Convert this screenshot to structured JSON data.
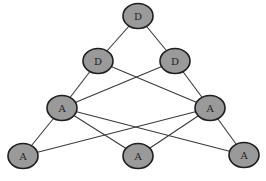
{
  "diagram": {
    "type": "layered-graph",
    "colors": {
      "node_fill": "#9a9a9a",
      "node_stroke": "#1e1e1e",
      "edge": "#3a3a3a",
      "background": "#ffffff"
    },
    "nodes": [
      {
        "id": "d1",
        "label": "D",
        "x": 138,
        "y": 16
      },
      {
        "id": "d2",
        "label": "D",
        "x": 98,
        "y": 61
      },
      {
        "id": "d3",
        "label": "D",
        "x": 175,
        "y": 61
      },
      {
        "id": "a1",
        "label": "A",
        "x": 62,
        "y": 108
      },
      {
        "id": "a2",
        "label": "A",
        "x": 210,
        "y": 108
      },
      {
        "id": "a3",
        "label": "A",
        "x": 23,
        "y": 156
      },
      {
        "id": "a4",
        "label": "A",
        "x": 138,
        "y": 156
      },
      {
        "id": "a5",
        "label": "A",
        "x": 244,
        "y": 155
      }
    ],
    "edges": [
      [
        "d1",
        "d2"
      ],
      [
        "d1",
        "d3"
      ],
      [
        "d2",
        "a1"
      ],
      [
        "d2",
        "a2"
      ],
      [
        "d3",
        "a1"
      ],
      [
        "d3",
        "a2"
      ],
      [
        "a1",
        "a3"
      ],
      [
        "a1",
        "a4"
      ],
      [
        "a1",
        "a5"
      ],
      [
        "a2",
        "a3"
      ],
      [
        "a2",
        "a4"
      ],
      [
        "a2",
        "a5"
      ]
    ]
  }
}
